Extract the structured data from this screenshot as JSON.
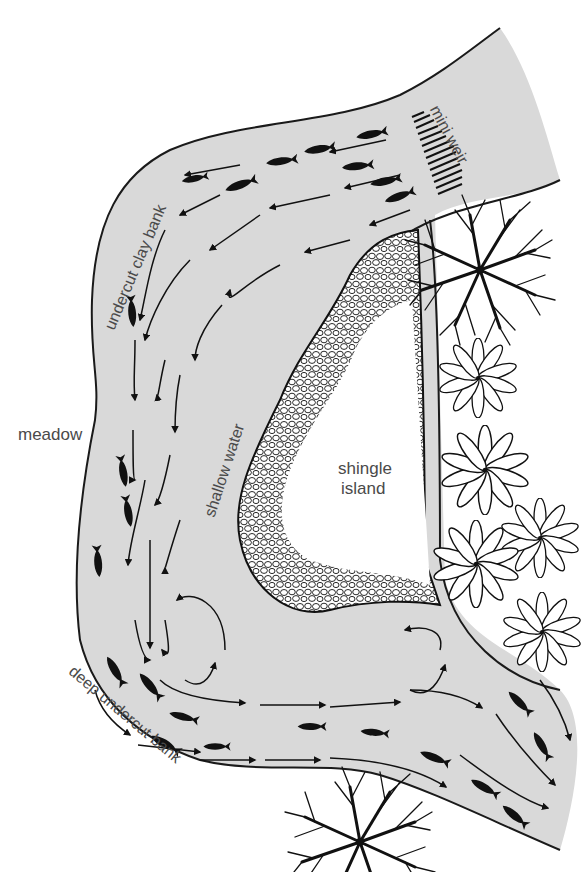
{
  "diagram": {
    "type": "river-bend plan view",
    "colors": {
      "water": "#d9d9d9",
      "bank_line": "#1a1a1a",
      "land": "#ffffff",
      "text": "#4a4a4a",
      "ink": "#111111"
    },
    "labels": {
      "mini_weir": "mini weir",
      "undercut_clay_bank": "undercut clay bank",
      "meadow": "meadow",
      "shallow_water": "shallow water",
      "shingle_island_line1": "shingle",
      "shingle_island_line2": "island",
      "deep_undercut_bank": "deep undercut bank"
    },
    "features": [
      {
        "name": "mini weir",
        "kind": "weir",
        "location": "upper right, river inflow"
      },
      {
        "name": "undercut clay bank",
        "kind": "bank",
        "location": "outer bank, upper left"
      },
      {
        "name": "meadow",
        "kind": "land",
        "location": "left"
      },
      {
        "name": "shallow water",
        "kind": "water zone",
        "location": "inner bend"
      },
      {
        "name": "shingle island",
        "kind": "island",
        "location": "center right"
      },
      {
        "name": "deep undercut bank",
        "kind": "bank",
        "location": "outer bank, lower left"
      },
      {
        "name": "tree",
        "kind": "vegetation",
        "count": 2
      },
      {
        "name": "flower plant",
        "kind": "vegetation",
        "count": 6
      }
    ],
    "fish_count": 22,
    "flow": "water enters over weir at top right, sweeps left along outer clay bank, down the left side, then right along bottom with eddies near island tail"
  }
}
